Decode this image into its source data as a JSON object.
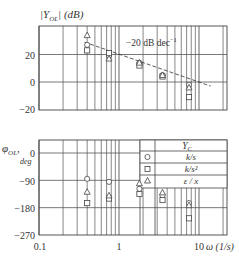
{
  "chart_data": [
    {
      "type": "scatter",
      "title": "|Y_OL| (dB)",
      "ylabel": "|Y_OL| (dB)",
      "xlabel": "ω (1/s)",
      "xscale": "log",
      "xlim": [
        0.1,
        22
      ],
      "ylim": [
        -20,
        40
      ],
      "yticks": [
        -20,
        0,
        20
      ],
      "xticks": [
        0.1,
        1,
        10
      ],
      "grid": true,
      "annotation": {
        "text": "−20 dB dec",
        "superscript": "−1",
        "line": {
          "x": [
            0.37,
            14
          ],
          "y": [
            29,
            -3
          ]
        }
      },
      "series": [
        {
          "name": "k/s",
          "marker": "circle",
          "x": [
            0.4,
            0.75,
            1.8,
            3.5,
            7.5
          ],
          "y": [
            27,
            19,
            14,
            5,
            -2
          ]
        },
        {
          "name": "k/s²",
          "marker": "square",
          "x": [
            0.4,
            0.75,
            1.8,
            3.5,
            7.5
          ],
          "y": [
            23,
            21,
            12,
            4,
            -11
          ]
        },
        {
          "name": "ε / x",
          "marker": "triangle",
          "x": [
            0.4,
            0.75,
            1.8,
            3.5,
            7.5
          ],
          "y": [
            34,
            17,
            14,
            5,
            -4
          ]
        }
      ]
    },
    {
      "type": "scatter",
      "ylabel": "φ_OL, deg",
      "xlabel": "ω (1/s)",
      "xscale": "log",
      "xlim": [
        0.1,
        22
      ],
      "ylim": [
        -270,
        40
      ],
      "yticks": [
        -270,
        -180,
        -90,
        0
      ],
      "xticks": [
        0.1,
        1,
        10
      ],
      "grid": true,
      "legend": {
        "header": "Y_C",
        "position": "upper right",
        "entries": [
          {
            "marker": "circle",
            "label": "k/s"
          },
          {
            "marker": "square",
            "label": "k/s²"
          },
          {
            "marker": "triangle",
            "label": "ε / x"
          }
        ]
      },
      "series": [
        {
          "name": "k/s",
          "marker": "circle",
          "x": [
            0.4,
            0.75,
            1.8,
            3.5,
            7.5
          ],
          "y": [
            -85,
            -95,
            -118,
            -140,
            -165
          ]
        },
        {
          "name": "k/s²",
          "marker": "square",
          "x": [
            0.4,
            0.75,
            1.8,
            3.5,
            7.5
          ],
          "y": [
            -165,
            -150,
            -135,
            -155,
            -215
          ]
        },
        {
          "name": "ε / x",
          "marker": "triangle",
          "x": [
            0.4,
            0.75,
            1.8,
            3.5,
            7.5
          ],
          "y": [
            -128,
            -140,
            -100,
            -130,
            -172
          ]
        }
      ]
    }
  ],
  "labels": {
    "top_ylabel_main": "|Y",
    "top_ylabel_sub": "OL",
    "top_ylabel_unit": "| (dB)",
    "annotation_main": "−20 dB dec",
    "annotation_sup": "−1",
    "bottom_ylabel_main": "φ",
    "bottom_ylabel_sub": "OL",
    "bottom_ylabel_comma": ",",
    "bottom_ylabel_unit": "deg",
    "top_yticks": [
      "20",
      "0",
      "−20"
    ],
    "bottom_yticks": [
      "0",
      "−90",
      "−180",
      "−270"
    ],
    "xticks": [
      "0.1",
      "1",
      "10"
    ],
    "xaxis_label": "ω (1/s)",
    "legend_header_main": "Y",
    "legend_header_sub": "C",
    "legend_entries": [
      "k/s",
      "k/s²",
      "ε / x"
    ]
  }
}
